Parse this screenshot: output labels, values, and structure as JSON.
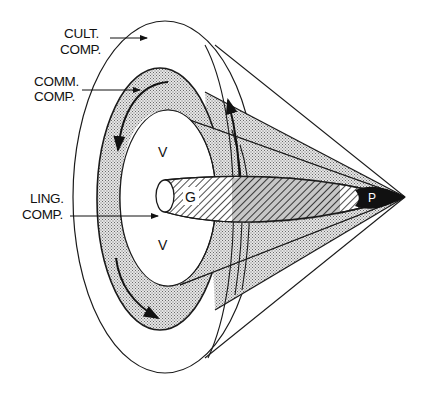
{
  "diagram": {
    "type": "cone-of-competences",
    "labels": {
      "cultural": [
        "CULT.",
        "COMP."
      ],
      "communicative": [
        "COMM.",
        "COMP."
      ],
      "linguistic": [
        "LING.",
        "COMP."
      ]
    },
    "inner_labels": {
      "v_top": "V",
      "v_bottom": "V",
      "g": "G",
      "p": "P"
    },
    "colors": {
      "line": "#1a1a1a",
      "stipple_fill": "#cfcfcf",
      "hatch": "#2a2a2a",
      "apex_fill": "#111111",
      "background": "#ffffff"
    }
  }
}
